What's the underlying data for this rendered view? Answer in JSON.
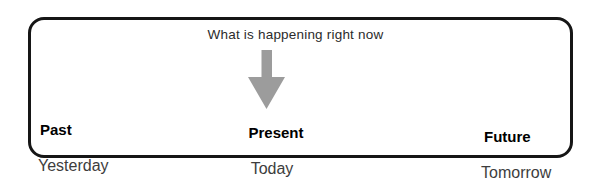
{
  "diagram": {
    "caption": "What is happening right now",
    "arrow": {
      "direction": "down",
      "color": "#9c9c9c"
    },
    "columns": [
      {
        "id": "past",
        "label": "Past",
        "sublabel": "Yesterday"
      },
      {
        "id": "present",
        "label": "Present",
        "sublabel": "Today"
      },
      {
        "id": "future",
        "label": "Future",
        "sublabel": "Tomorrow"
      }
    ],
    "colors": {
      "background": "#ffffff",
      "box_border": "#161616",
      "caption_text": "#2b2b2b",
      "label_text": "#000000",
      "sublabel_text": "#3d3d3d"
    }
  }
}
